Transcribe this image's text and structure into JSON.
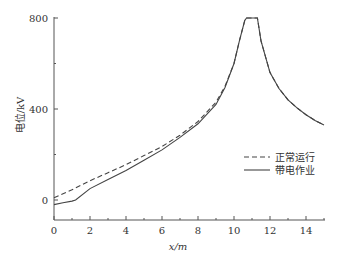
{
  "chart_data": {
    "type": "line",
    "title": "",
    "xlabel": "x/m",
    "ylabel": "电位/kV",
    "xlim": [
      0,
      15
    ],
    "ylim": [
      -90,
      820
    ],
    "xticks": [
      0,
      2,
      4,
      6,
      8,
      10,
      12,
      14
    ],
    "yticks": [
      0,
      400,
      800
    ],
    "grid": false,
    "legend_position": "lower right",
    "series": [
      {
        "name": "正常运行",
        "style": "dashed",
        "x": [
          0,
          1,
          2,
          3,
          4,
          5,
          6,
          7,
          8,
          9,
          9.5,
          10,
          10.3,
          10.6,
          10.7,
          11.3,
          11.5,
          12,
          12.5,
          13,
          13.5,
          14,
          14.5,
          15
        ],
        "y": [
          10,
          45,
          85,
          120,
          155,
          195,
          235,
          285,
          345,
          430,
          500,
          600,
          700,
          790,
          800,
          800,
          700,
          560,
          490,
          440,
          405,
          375,
          350,
          330
        ]
      },
      {
        "name": "带电作业",
        "style": "solid",
        "x": [
          0,
          0.5,
          1,
          1.2,
          2,
          3,
          4,
          5,
          6,
          7,
          8,
          9,
          9.5,
          10,
          10.3,
          10.6,
          10.7,
          11.3,
          11.5,
          12,
          12.5,
          13,
          13.5,
          14,
          14.5,
          15
        ],
        "y": [
          -20,
          -12,
          -5,
          0,
          50,
          90,
          130,
          175,
          220,
          275,
          335,
          420,
          495,
          600,
          700,
          790,
          800,
          800,
          700,
          560,
          490,
          440,
          405,
          375,
          350,
          330
        ]
      }
    ]
  },
  "legend": {
    "items": [
      {
        "label": "正常运行",
        "style": "dashed"
      },
      {
        "label": "带电作业",
        "style": "solid"
      }
    ]
  },
  "axes": {
    "xlabel": "x/m",
    "ylabel": "电位/kV",
    "xtick_labels": [
      "0",
      "2",
      "4",
      "6",
      "8",
      "10",
      "12",
      "14"
    ],
    "ytick_labels": [
      "0",
      "400",
      "800"
    ]
  }
}
